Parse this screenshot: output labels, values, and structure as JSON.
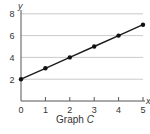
{
  "chart_data": {
    "type": "line",
    "title": "Graph C",
    "xlabel": "x",
    "ylabel": "y",
    "x": [
      0,
      1,
      2,
      3,
      4,
      5
    ],
    "series": [
      {
        "name": "Graph C",
        "values": [
          2,
          3,
          4,
          5,
          6,
          7
        ]
      }
    ],
    "xticks": [
      0,
      1,
      2,
      3,
      4,
      5
    ],
    "yticks": [
      2,
      4,
      6,
      8
    ],
    "xlim": [
      0,
      5
    ],
    "ylim": [
      0,
      8
    ],
    "grid": "horizontal",
    "legend": null,
    "markers": true
  },
  "caption": {
    "prefix": "Graph ",
    "letter": "C"
  },
  "axes": {
    "x_label": "x",
    "y_label": "y",
    "x_tick_labels": [
      "0",
      "1",
      "2",
      "3",
      "4",
      "5"
    ],
    "y_tick_labels": [
      "2",
      "4",
      "6",
      "8"
    ]
  },
  "colors": {
    "line": "#1a1a1a",
    "marker": "#111111",
    "axis": "#555555",
    "grid": "#bbbbbb",
    "text": "#333333"
  }
}
